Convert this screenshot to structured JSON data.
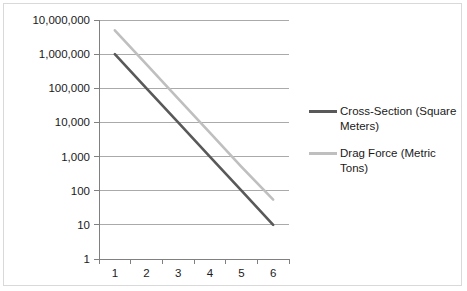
{
  "chart_data": {
    "type": "line",
    "title": "",
    "xlabel": "",
    "ylabel": "",
    "x": [
      1,
      2,
      3,
      4,
      5,
      6
    ],
    "categories": [
      "1",
      "2",
      "3",
      "4",
      "5",
      "6"
    ],
    "xtick_labels": [
      "1",
      "2",
      "3",
      "4",
      "5",
      "6"
    ],
    "ytick_labels": [
      "1",
      "10",
      "100",
      "1,000",
      "10,000",
      "100,000",
      "1,000,000",
      "10,000,000"
    ],
    "ytick_values": [
      1,
      10,
      100,
      1000,
      10000,
      100000,
      1000000,
      10000000
    ],
    "yscale": "log",
    "ylim": [
      1,
      10000000
    ],
    "grid": true,
    "legend_position": "right",
    "series": [
      {
        "name": "Cross-Section (Square Meters)",
        "legend_line_1": "Cross-Section (Square",
        "legend_line_2": "Meters)",
        "color": "#595959",
        "values": [
          1000000,
          100000,
          10000,
          1000,
          100,
          10
        ]
      },
      {
        "name": "Drag Force (Metric Tons)",
        "legend_line_1": "Drag Force (Metric",
        "legend_line_2": "Tons)",
        "color": "#bfbfbf",
        "values": [
          5000000,
          500000,
          50000,
          5000,
          500,
          55
        ]
      }
    ]
  },
  "colors": {
    "frame_border": "#d9d9d9",
    "gridline": "#aaaaaa",
    "axis": "#808080",
    "text": "#1a1a1a",
    "background": "#ffffff"
  },
  "legend": {
    "entries": [
      {
        "line1": "Cross-Section (Square",
        "line2": "Meters)",
        "color": "#595959"
      },
      {
        "line1": "Drag Force (Metric",
        "line2": "Tons)",
        "color": "#bfbfbf"
      }
    ]
  }
}
